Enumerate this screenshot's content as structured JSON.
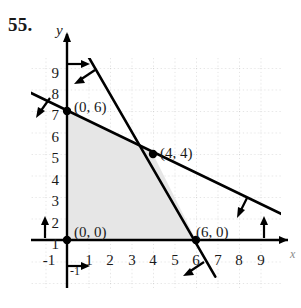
{
  "problem": {
    "number": "55."
  },
  "axes": {
    "x_label": "x",
    "y_label": "y",
    "x_ticks": [
      "-1",
      "1",
      "2",
      "3",
      "4",
      "5",
      "6",
      "7",
      "8",
      "9"
    ],
    "y_ticks": [
      "-1",
      "1",
      "2",
      "3",
      "4",
      "5",
      "6",
      "7",
      "8",
      "9"
    ]
  },
  "points": {
    "origin": "(0, 0)",
    "y_intercept": "(0, 6)",
    "intersection": "(4, 4)",
    "x_intercept": "(6, 0)"
  },
  "colors": {
    "shade": "#e6e6e6",
    "line": "#000000",
    "grid": "#bdbdbd",
    "axis": "#000000"
  },
  "chart_data": {
    "type": "line",
    "title": "",
    "xlabel": "x",
    "ylabel": "y",
    "xlim": [
      -1.7,
      10.4
    ],
    "ylim": [
      -1.7,
      10.4
    ],
    "grid": true,
    "legend": "none",
    "series": [
      {
        "name": "steep-boundary-line",
        "points": [
          [
            -0.2,
            10.6
          ],
          [
            6.9,
            -1.7
          ]
        ],
        "note": "passes through (4, 4) and (6, 0)"
      },
      {
        "name": "shallow-boundary-line",
        "points": [
          [
            -1.7,
            6.85
          ],
          [
            10.2,
            1.1
          ]
        ],
        "note": "passes through (0, 6) and (4, 4)"
      }
    ],
    "shaded_region": {
      "name": "feasible-region",
      "vertices": [
        [
          0,
          0
        ],
        [
          0,
          6
        ],
        [
          4,
          4
        ],
        [
          6,
          0
        ]
      ],
      "fill": "#e6e6e6"
    },
    "labeled_points": [
      {
        "label": "(0, 0)",
        "x": 0,
        "y": 0
      },
      {
        "label": "(0, 6)",
        "x": 0,
        "y": 6
      },
      {
        "label": "(4, 4)",
        "x": 4,
        "y": 4
      },
      {
        "label": "(6, 0)",
        "x": 6,
        "y": 0
      }
    ],
    "direction_arrows": [
      {
        "name": "x-nonneg-on-yaxis-top",
        "points_toward": "right"
      },
      {
        "name": "x-nonneg-below-origin",
        "points_toward": "right"
      },
      {
        "name": "y-nonneg-left-of-origin",
        "points_toward": "up"
      },
      {
        "name": "y-nonneg-right-end",
        "points_toward": "up"
      },
      {
        "name": "steep-line-upper",
        "points_toward": "down-left"
      },
      {
        "name": "steep-line-lower",
        "points_toward": "down-left"
      },
      {
        "name": "shallow-line-left",
        "points_toward": "down-left"
      },
      {
        "name": "shallow-line-right",
        "points_toward": "down-left"
      }
    ]
  }
}
